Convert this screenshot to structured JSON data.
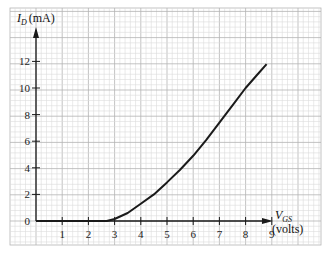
{
  "chart_data": {
    "type": "line",
    "title": "",
    "xlabel": "V_GS (volts)",
    "ylabel": "I_D (mA)",
    "x_label_main": "V",
    "x_label_sub": "GS",
    "x_label_unit": "(volts)",
    "y_label_main": "I",
    "y_label_sub": "D",
    "y_label_unit": "(mA)",
    "xlim": [
      0,
      9.5
    ],
    "ylim": [
      0,
      13
    ],
    "x_ticks": [
      1,
      2,
      3,
      4,
      5,
      6,
      7,
      8,
      9
    ],
    "y_ticks": [
      0,
      2,
      4,
      6,
      8,
      10,
      12
    ],
    "grid": true,
    "legend": null,
    "series": [
      {
        "name": "I_D vs V_GS",
        "x": [
          0,
          2.7,
          3.0,
          3.5,
          4.0,
          4.5,
          5.0,
          5.5,
          6.0,
          6.5,
          7.0,
          7.5,
          8.0,
          8.4,
          8.8
        ],
        "y": [
          0,
          0,
          0.15,
          0.6,
          1.3,
          2.0,
          2.9,
          3.85,
          4.9,
          6.1,
          7.4,
          8.7,
          10.0,
          10.9,
          11.8
        ]
      }
    ]
  },
  "colors": {
    "grid_minor": "#dcdcdc",
    "grid_major": "#b4b4b4",
    "axis": "#1a1a1a",
    "curve": "#1a1a1a",
    "paper": "#ffffff"
  }
}
